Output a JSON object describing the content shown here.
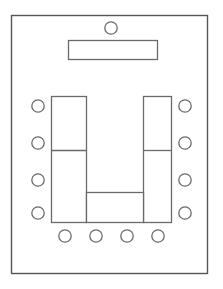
{
  "diagram": {
    "type": "floor-plan",
    "canvas": {
      "width": 223,
      "height": 289
    },
    "colors": {
      "background": "#ffffff",
      "room_stroke": "#555555",
      "furniture_stroke": "#6a6a6a",
      "furniture_fill": "#ffffff"
    },
    "room": {
      "label": "room-boundary",
      "x": 11.5,
      "y": 15.5,
      "width": 196,
      "height": 258
    },
    "presenter_seat": {
      "label": "presenter-seat",
      "cx": 111,
      "cy": 28,
      "r": 6.2
    },
    "head_table": {
      "label": "head-table",
      "x": 68.5,
      "y": 40.5,
      "width": 89,
      "height": 19
    },
    "u_table": {
      "label": "u-shaped-table",
      "left_wing": {
        "x": 51.5,
        "y": 96.5,
        "width": 35,
        "height": 126
      },
      "right_wing": {
        "x": 143.5,
        "y": 96.5,
        "width": 28,
        "height": 126
      },
      "cross_bar": {
        "x": 86.5,
        "y": 192.5,
        "width": 57,
        "height": 30
      },
      "left_divider": {
        "x1": 51.5,
        "y1": 150.5,
        "x2": 86.5,
        "y2": 150.5
      },
      "right_divider": {
        "x1": 143.5,
        "y1": 150.5,
        "x2": 171.5,
        "y2": 150.5
      }
    },
    "seats": {
      "left": [
        {
          "label": "seat-left-1",
          "cx": 38,
          "cy": 106,
          "r": 6.2
        },
        {
          "label": "seat-left-2",
          "cx": 38,
          "cy": 143,
          "r": 6.2
        },
        {
          "label": "seat-left-3",
          "cx": 38,
          "cy": 180,
          "r": 6.2
        },
        {
          "label": "seat-left-4",
          "cx": 38,
          "cy": 213,
          "r": 6.2
        }
      ],
      "right": [
        {
          "label": "seat-right-1",
          "cx": 185,
          "cy": 106,
          "r": 6.2
        },
        {
          "label": "seat-right-2",
          "cx": 185,
          "cy": 143,
          "r": 6.2
        },
        {
          "label": "seat-right-3",
          "cx": 185,
          "cy": 180,
          "r": 6.2
        },
        {
          "label": "seat-right-4",
          "cx": 185,
          "cy": 213,
          "r": 6.2
        }
      ],
      "bottom": [
        {
          "label": "seat-bottom-1",
          "cx": 65,
          "cy": 236,
          "r": 6.2
        },
        {
          "label": "seat-bottom-2",
          "cx": 96,
          "cy": 236,
          "r": 6.2
        },
        {
          "label": "seat-bottom-3",
          "cx": 127,
          "cy": 236,
          "r": 6.2
        },
        {
          "label": "seat-bottom-4",
          "cx": 158,
          "cy": 236,
          "r": 6.2
        }
      ]
    },
    "counts": {
      "total_seats": 13,
      "left_seats": 4,
      "right_seats": 4,
      "bottom_seats": 4,
      "presenter_seats": 1
    }
  }
}
